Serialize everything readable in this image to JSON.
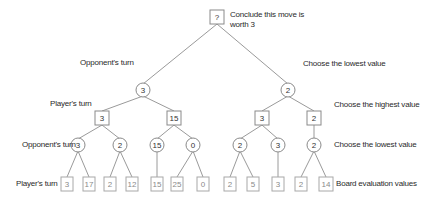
{
  "labels": {
    "root_note_line1": "Conclude this move is",
    "root_note_line2": "worth 3",
    "left": {
      "level1": "Opponent's turn",
      "level2": "Player's turn",
      "level3": "Opponent's turn",
      "level4": "Player's turn"
    },
    "right": {
      "level1": "Choose the lowest value",
      "level2": "Choose the highest value",
      "level3": "Choose the lowest value",
      "level4": "Board evaluation values"
    }
  },
  "tree": {
    "root": {
      "value": "?",
      "shape": "square"
    },
    "level1": [
      {
        "value": "3",
        "shape": "circle"
      },
      {
        "value": "2",
        "shape": "circle"
      }
    ],
    "level2": [
      {
        "value": "3",
        "shape": "square"
      },
      {
        "value": "15",
        "shape": "square"
      },
      {
        "value": "3",
        "shape": "square"
      },
      {
        "value": "2",
        "shape": "square"
      }
    ],
    "level3": [
      {
        "value": "3",
        "shape": "circle"
      },
      {
        "value": "2",
        "shape": "circle"
      },
      {
        "value": "15",
        "shape": "circle"
      },
      {
        "value": "0",
        "shape": "circle"
      },
      {
        "value": "2",
        "shape": "circle"
      },
      {
        "value": "3",
        "shape": "circle"
      },
      {
        "value": "2",
        "shape": "circle"
      }
    ],
    "leaves": [
      {
        "value": "3"
      },
      {
        "value": "17"
      },
      {
        "value": "2"
      },
      {
        "value": "12"
      },
      {
        "value": "15"
      },
      {
        "value": "25"
      },
      {
        "value": "0"
      },
      {
        "value": "2"
      },
      {
        "value": "5"
      },
      {
        "value": "3"
      },
      {
        "value": "2"
      },
      {
        "value": "14"
      }
    ]
  }
}
